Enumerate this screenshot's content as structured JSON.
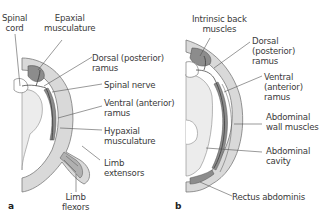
{
  "panels": [
    {
      "letter": "a",
      "labels": {
        "spinal_cord": "Spinal\ncord",
        "epaxial": "Epaxial\nmusculature",
        "dorsal_ramus": "Dorsal (posterior)\nramus",
        "spinal_nerve": "Spinal nerve",
        "ventral_ramus": "Ventral (anterior)\nramus",
        "hypaxial": "Hypaxial\nmusculature",
        "limb_extensors": "Limb\nextensors",
        "limb_flexors": "Limb\nflexors"
      }
    },
    {
      "letter": "b",
      "labels": {
        "intrinsic_back": "Intrinsic back\nmuscles",
        "dorsal_ramus": "Dorsal\n(posterior)\nramus",
        "ventral_ramus": "Ventral\n(anterior)\nramus",
        "abdominal_wall": "Abdominal\nwall muscles",
        "abdominal_cavity": "Abdominal\ncavity",
        "rectus": "Rectus abdominis"
      }
    }
  ],
  "colors": {
    "outer_wall": "#d9d9d9",
    "muscle_dark": "#8c8c8c",
    "muscle_mid": "#b0b0b0",
    "cavity": "#ececec",
    "leader": "#555555"
  }
}
